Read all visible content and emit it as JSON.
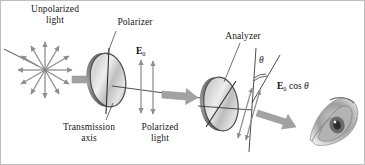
{
  "figure": {
    "width": 365,
    "height": 165,
    "background": "#ffffff",
    "border_color": "#b8b8b8"
  },
  "labels": {
    "unpolarized_light": "Unpolarized\nlight",
    "polarizer": "Polarizer",
    "transmission_axis": "Transmission\naxis",
    "polarized_light": "Polarized\nlight",
    "analyzer": "Analyzer"
  },
  "vectors": {
    "e0": {
      "symbol": "E",
      "subscript": "0"
    },
    "e0_cos_theta": {
      "symbol": "E",
      "subscript": "0",
      "operator": "cos",
      "angle": "θ"
    }
  },
  "angle": {
    "symbol": "θ",
    "description": "angle between polarizer and analyzer transmission axes"
  },
  "colors": {
    "arrow_gray": "#9a9a9a",
    "arrow_gray_dark": "#7d7d7d",
    "line_dark": "#2b2b2b",
    "disc_edge": "#4a4a4a",
    "disc_light": "#f2f2f2",
    "disc_mid": "#c9c9c9",
    "disc_shadow": "#8c8c8c",
    "eye_gray": "#8e8e8e",
    "text": "#181818"
  },
  "elements": {
    "starburst_ray_count": 12,
    "polarized_field_arrow_count": 2,
    "analyzer_field_arrow_count": 2,
    "eye": "human-eye-illustration"
  }
}
